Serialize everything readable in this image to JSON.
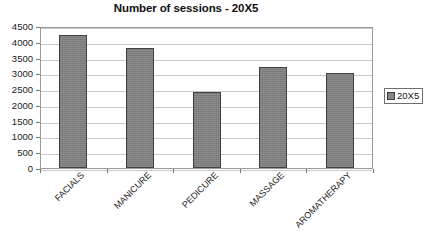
{
  "chart_data": {
    "type": "bar",
    "title": "Number of sessions - 20X5",
    "xlabel": "",
    "ylabel": "",
    "categories": [
      "FACIALS",
      "MANICURE",
      "PEDICURE",
      "MASSAGE",
      "AROMATHERAPY"
    ],
    "values": [
      4200,
      3800,
      2400,
      3200,
      3000
    ],
    "series": [
      {
        "name": "20X5",
        "values": [
          4200,
          3800,
          2400,
          3200,
          3000
        ]
      }
    ],
    "ylim": [
      0,
      4500
    ],
    "ytick_step": 500,
    "yticks": [
      0,
      500,
      1000,
      1500,
      2000,
      2500,
      3000,
      3500,
      4000,
      4500
    ],
    "ytick_labels": [
      "0",
      "500",
      "1000",
      "1500",
      "2000",
      "2500",
      "3000",
      "3500",
      "4000",
      "4500"
    ],
    "grid": true,
    "grid_axis": "y",
    "legend_position": "right",
    "legend_entries": [
      "20X5"
    ],
    "bar_color": "#808080",
    "bar_border_color": "#404040",
    "grid_color": "#c9c9c9",
    "plot_border_color": "#9a9a9a",
    "xtick_label_rotation": -45
  },
  "legend": {
    "entries": [
      {
        "label": "20X5",
        "color": "#808080"
      }
    ]
  }
}
